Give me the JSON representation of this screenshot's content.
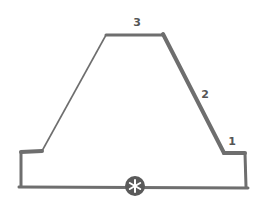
{
  "diagram": {
    "stroke_color": "#6e6e6e",
    "badge_color": "#5a5a5a",
    "labels": {
      "segment_1": "1",
      "segment_2": "2",
      "segment_3": "3"
    },
    "badge_icon": "asterisk-icon",
    "badge_glyph": "✱"
  }
}
